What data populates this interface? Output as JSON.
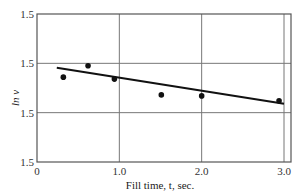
{
  "chart_data": {
    "type": "scatter",
    "title": "",
    "xlabel": "Fill time, t, sec.",
    "ylabel": "ln v",
    "x_ticks": [
      "0",
      "1.0",
      "2.0",
      "3.0"
    ],
    "x_tick_values": [
      0,
      1.0,
      2.0,
      3.0
    ],
    "y_ticks": [
      "1.5",
      "1.5",
      "1.5",
      "1.5"
    ],
    "y_tick_positions": [
      0,
      1,
      2,
      3
    ],
    "xlim": [
      0,
      3.08
    ],
    "ylim": [
      0,
      3
    ],
    "grid": true,
    "legend": null,
    "series": [
      {
        "name": "measured",
        "kind": "scatter",
        "x": [
          0.32,
          0.62,
          0.94,
          1.51,
          2.0,
          2.94
        ],
        "y": [
          1.72,
          1.95,
          1.68,
          1.36,
          1.34,
          1.24
        ]
      },
      {
        "name": "fit",
        "kind": "line",
        "x": [
          0.24,
          3.0
        ],
        "y": [
          1.91,
          1.18
        ]
      }
    ],
    "note": "All y tick labels render as '1.5' in the image; y values are in gridline units (0 = bottom axis, 3 = top)."
  }
}
